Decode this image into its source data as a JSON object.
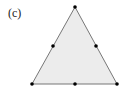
{
  "figure": {
    "label": "(c)",
    "fill_color": "#ececec",
    "stroke_color": "#777777",
    "node_color": "#000000",
    "vertices": [
      {
        "x": 75,
        "y": 7
      },
      {
        "x": 32,
        "y": 84
      },
      {
        "x": 117,
        "y": 84
      }
    ],
    "nodes": [
      {
        "name": "vertex-top",
        "x": 75,
        "y": 7
      },
      {
        "name": "vertex-bottom-left",
        "x": 32,
        "y": 84
      },
      {
        "name": "vertex-bottom-right",
        "x": 117,
        "y": 84
      },
      {
        "name": "midpoint-left-edge",
        "x": 53,
        "y": 46
      },
      {
        "name": "midpoint-right-edge",
        "x": 96,
        "y": 46
      },
      {
        "name": "midpoint-bottom-edge",
        "x": 75,
        "y": 84
      }
    ]
  }
}
